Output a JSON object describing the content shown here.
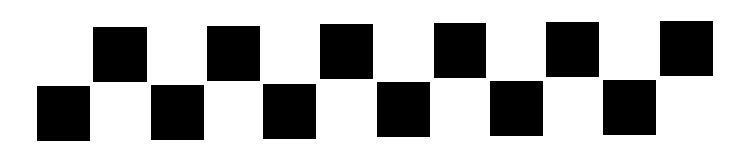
{
  "pattern": {
    "description": "Two-row staggered checker pattern of black squares on white",
    "background": "#ffffff",
    "fill": "#000000",
    "squares": [
      {
        "row": "bottom",
        "x": 37,
        "y": 86,
        "w": 53,
        "h": 55
      },
      {
        "row": "top",
        "x": 93,
        "y": 27,
        "w": 54,
        "h": 55
      },
      {
        "row": "bottom",
        "x": 151,
        "y": 85,
        "w": 53,
        "h": 55
      },
      {
        "row": "top",
        "x": 207,
        "y": 26,
        "w": 53,
        "h": 55
      },
      {
        "row": "bottom",
        "x": 263,
        "y": 84,
        "w": 53,
        "h": 55
      },
      {
        "row": "top",
        "x": 320,
        "y": 24,
        "w": 53,
        "h": 55
      },
      {
        "row": "bottom",
        "x": 377,
        "y": 82,
        "w": 53,
        "h": 55
      },
      {
        "row": "top",
        "x": 434,
        "y": 23,
        "w": 52,
        "h": 55
      },
      {
        "row": "bottom",
        "x": 490,
        "y": 81,
        "w": 53,
        "h": 55
      },
      {
        "row": "top",
        "x": 546,
        "y": 22,
        "w": 53,
        "h": 55
      },
      {
        "row": "bottom",
        "x": 603,
        "y": 80,
        "w": 53,
        "h": 55
      },
      {
        "row": "top",
        "x": 660,
        "y": 21,
        "w": 53,
        "h": 55
      }
    ]
  }
}
